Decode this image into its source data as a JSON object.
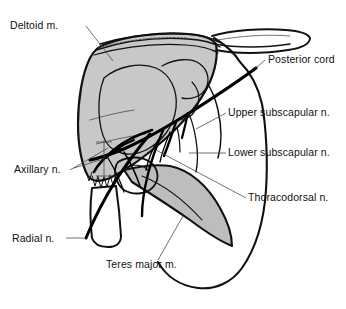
{
  "figure": {
    "background_color": "#ffffff",
    "ink_color": "#111111",
    "leader_color": "#4a4a4a"
  },
  "structures": [
    {
      "id": "deltoid",
      "name": "Deltoid m.",
      "fill": "#c8c8c8",
      "stroke": "#111111"
    },
    {
      "id": "teres-major",
      "name": "Teres major m.",
      "fill": "#bdbdbd",
      "stroke": "#111111"
    },
    {
      "id": "scapula",
      "name": "Scapula",
      "fill": "#ffffff",
      "stroke": "#111111"
    },
    {
      "id": "humerus",
      "name": "Humerus",
      "fill": "#ffffff",
      "stroke": "#111111"
    }
  ],
  "labels": [
    {
      "id": "deltoid",
      "text": "Deltoid m.",
      "x": 10,
      "y": 29,
      "anchor": "start",
      "leader": "M 86 26 L 113 61"
    },
    {
      "id": "posterior-cord",
      "text": "Posterior cord",
      "x": 268,
      "y": 63,
      "anchor": "start",
      "leader": "M 265 60 L 255 69"
    },
    {
      "id": "upper-subscapular",
      "text": "Upper subscapular n.",
      "x": 228,
      "y": 116,
      "anchor": "start",
      "leader": "M 226 113 L 196 129"
    },
    {
      "id": "lower-subscapular",
      "text": "Lower subscapular n.",
      "x": 228,
      "y": 156,
      "anchor": "start",
      "leader": "M 226 153 L 189 153"
    },
    {
      "id": "thoracodorsal",
      "text": "Thoracodorsal n.",
      "x": 248,
      "y": 201,
      "anchor": "start",
      "leader": "M 246 198 L 156 150"
    },
    {
      "id": "axillary",
      "text": "Axillary n.",
      "x": 14,
      "y": 173,
      "anchor": "start",
      "leader": "M 70 170 L 108 148"
    },
    {
      "id": "radial",
      "text": "Radial n.",
      "x": 12,
      "y": 242,
      "anchor": "start",
      "leader": "M 66 238 L 84 238"
    },
    {
      "id": "teres-major",
      "text": "Teres major m.",
      "x": 106,
      "y": 268,
      "anchor": "start",
      "leader": "M 158 260 L 183 216"
    }
  ]
}
